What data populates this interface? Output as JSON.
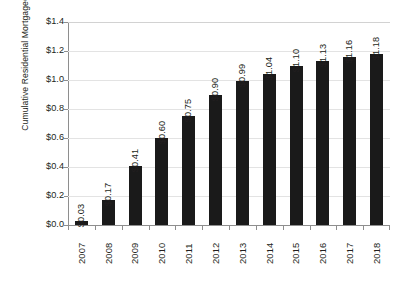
{
  "chart_data": {
    "type": "bar",
    "title": "",
    "subtitle": "",
    "xlabel": "",
    "ylabel": "Cumulative Residential Mortgage Charge-Offs (trillions)",
    "ylabel_line1": "Cumulative Residential Mortgage",
    "ylabel_line2": "Charge-Offs (trillions)",
    "categories": [
      "2007",
      "2008",
      "2009",
      "2010",
      "2011",
      "2012",
      "2013",
      "2014",
      "2015",
      "2016",
      "2017",
      "2018"
    ],
    "values": [
      0.03,
      0.17,
      0.41,
      0.6,
      0.75,
      0.9,
      0.99,
      1.04,
      1.1,
      1.13,
      1.16,
      1.18
    ],
    "data_labels": [
      "$0.03",
      "$0.17",
      "$0.41",
      "$0.60",
      "$0.75",
      "$0.90",
      "$0.99",
      "$1.04",
      "$1.10",
      "$1.13",
      "$1.16",
      "$1.18"
    ],
    "ylim": [
      0.0,
      1.4
    ],
    "ytick_values": [
      0.0,
      0.2,
      0.4,
      0.6,
      0.8,
      1.0,
      1.2,
      1.4
    ],
    "ytick_labels": [
      "$0.0",
      "$0.2",
      "$0.4",
      "$0.6",
      "$0.8",
      "$1.0",
      "$1.2",
      "$1.4"
    ],
    "grid": true,
    "legend": false,
    "legend_position": "none",
    "bar_color": "#1a1a1a",
    "grid_color": "#e3e3e3",
    "axis_color": "#8e8e8e",
    "background_color": "#ffffff",
    "text_color": "#231f20",
    "data_label_orientation": "vertical",
    "xtick_label_orientation": "vertical"
  }
}
